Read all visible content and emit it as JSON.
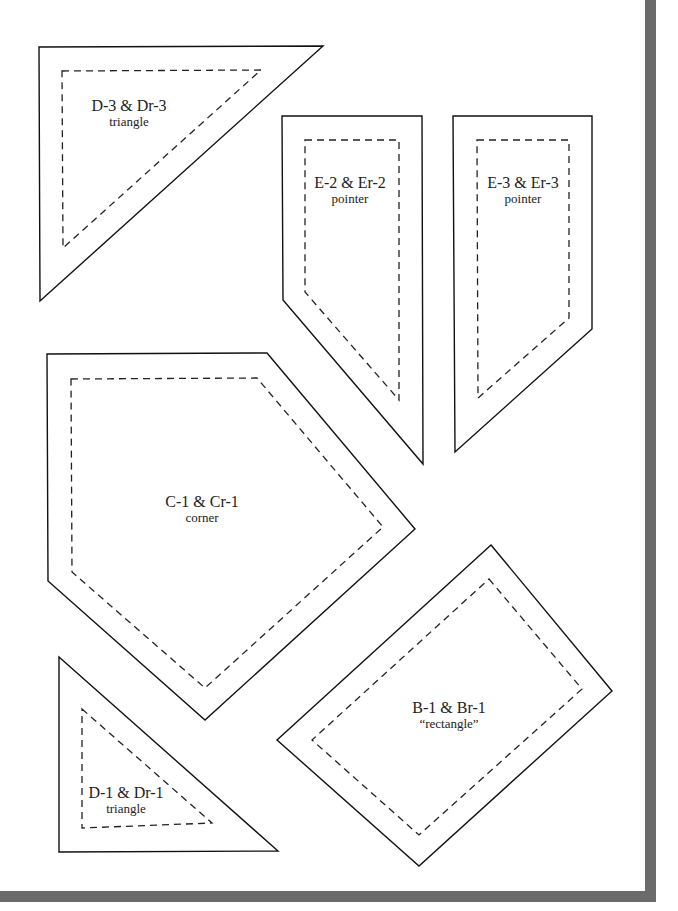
{
  "pieces": [
    {
      "id": "D-3",
      "main": "D-3 & Dr-3",
      "sub": "triangle"
    },
    {
      "id": "E-2",
      "main": "E-2 & Er-2",
      "sub": "pointer"
    },
    {
      "id": "E-3",
      "main": "E-3 & Er-3",
      "sub": "pointer"
    },
    {
      "id": "C-1",
      "main": "C-1 & Cr-1",
      "sub": "corner"
    },
    {
      "id": "B-1",
      "main": "B-1 & Br-1",
      "sub": "“rectangle”"
    },
    {
      "id": "D-1",
      "main": "D-1 & Dr-1",
      "sub": "triangle"
    }
  ],
  "colors": {
    "frame": "#6b6b6b",
    "line": "#111111",
    "background": "#ffffff"
  }
}
